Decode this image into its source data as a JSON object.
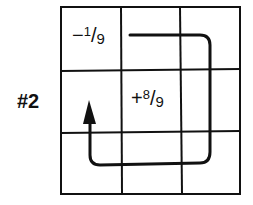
{
  "figure": {
    "label": "#2",
    "grid": {
      "rows": 3,
      "cols": 3
    },
    "cells": [
      {
        "row": 0,
        "col": 0,
        "sign": "−",
        "numerator": "1",
        "denominator": "9",
        "text": "−1/9"
      },
      {
        "row": 1,
        "col": 1,
        "sign": "+",
        "numerator": "8",
        "denominator": "9",
        "text": "+8/9"
      }
    ],
    "path": {
      "description": "clockwise loop arrow starting in top-middle cell, going right, down the right column, left along bottom row, ending with arrowhead pointing up in middle-left cell",
      "arrowhead_direction": "up"
    },
    "colors": {
      "line": "#111111",
      "background": "#ffffff"
    }
  }
}
